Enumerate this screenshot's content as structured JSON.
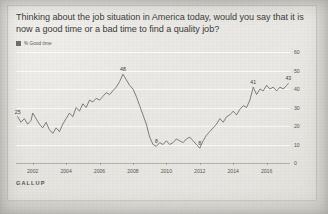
{
  "title": "Thinking about the job situation in America today, would you say that it is now a good time or a bad time to find a quality job?",
  "legend": {
    "label": "% Good time",
    "swatch_color": "#6f6e6a"
  },
  "source": "GALLUP",
  "colors": {
    "line": "#5b5a56",
    "background": "#d9d7d2",
    "card": "#f1efec",
    "grid": "#ffffff",
    "text": "#3b3b3a",
    "axis_text": "#57564f"
  },
  "chart_data": {
    "type": "line",
    "title": "Thinking about the job situation in America today, would you say that it is now a good time or a bad time to find a quality job?",
    "xlabel": "",
    "ylabel": "",
    "ylim": [
      0,
      60
    ],
    "xlim": [
      2001.0,
      2017.4
    ],
    "yticks": [
      0,
      10,
      20,
      30,
      40,
      50,
      60
    ],
    "xticks": [
      2002,
      2004,
      2006,
      2008,
      2010,
      2012,
      2014,
      2016
    ],
    "grid": true,
    "legend_position": "top-left",
    "series": [
      {
        "name": "% Good time",
        "x": [
          2001.1,
          2001.3,
          2001.5,
          2001.7,
          2001.9,
          2002.0,
          2002.2,
          2002.4,
          2002.6,
          2002.8,
          2003.0,
          2003.2,
          2003.4,
          2003.6,
          2003.8,
          2004.0,
          2004.2,
          2004.4,
          2004.6,
          2004.8,
          2005.0,
          2005.2,
          2005.4,
          2005.6,
          2005.8,
          2006.0,
          2006.2,
          2006.4,
          2006.6,
          2006.8,
          2007.0,
          2007.2,
          2007.4,
          2007.6,
          2007.8,
          2008.0,
          2008.2,
          2008.4,
          2008.6,
          2008.8,
          2009.0,
          2009.2,
          2009.4,
          2009.6,
          2009.8,
          2010.0,
          2010.2,
          2010.4,
          2010.6,
          2010.8,
          2011.0,
          2011.2,
          2011.4,
          2011.6,
          2011.8,
          2012.0,
          2012.2,
          2012.4,
          2012.6,
          2012.8,
          2013.0,
          2013.2,
          2013.4,
          2013.6,
          2013.8,
          2014.0,
          2014.2,
          2014.4,
          2014.6,
          2014.8,
          2015.0,
          2015.2,
          2015.4,
          2015.6,
          2015.8,
          2016.0,
          2016.2,
          2016.4,
          2016.6,
          2016.8,
          2017.0,
          2017.2,
          2017.3
        ],
        "y": [
          25,
          22,
          24,
          21,
          23,
          27,
          24,
          21,
          19,
          22,
          18,
          16,
          19,
          17,
          21,
          24,
          27,
          25,
          30,
          28,
          32,
          30,
          34,
          33,
          35,
          34,
          36,
          38,
          37,
          39,
          41,
          44,
          48,
          45,
          42,
          40,
          36,
          31,
          26,
          21,
          14,
          10,
          9,
          11,
          10,
          12,
          10,
          11,
          13,
          12,
          11,
          13,
          14,
          12,
          10,
          8,
          12,
          15,
          17,
          19,
          21,
          24,
          22,
          25,
          26,
          28,
          26,
          29,
          31,
          30,
          34,
          41,
          37,
          40,
          39,
          42,
          40,
          41,
          39,
          41,
          40,
          42,
          43
        ]
      }
    ],
    "annotations": [
      {
        "label": "25",
        "x": 2001.1,
        "y": 25
      },
      {
        "label": "48",
        "x": 2007.4,
        "y": 48
      },
      {
        "label": "8",
        "x": 2009.4,
        "y": 9
      },
      {
        "label": "8",
        "x": 2012.0,
        "y": 8
      },
      {
        "label": "41",
        "x": 2015.2,
        "y": 41
      },
      {
        "label": "43",
        "x": 2017.3,
        "y": 43
      }
    ]
  }
}
